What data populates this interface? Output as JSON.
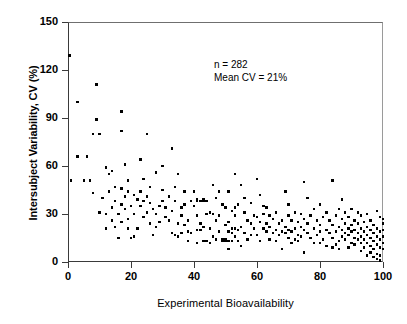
{
  "chart_data": {
    "type": "scatter",
    "title": "",
    "xlabel": "Experimental Bioavailability",
    "ylabel": "Intersubject Variability, CV (%)",
    "xlim": [
      0,
      100
    ],
    "ylim": [
      0,
      150
    ],
    "xticks": [
      0,
      20,
      40,
      60,
      80,
      100
    ],
    "yticks": [
      0,
      30,
      60,
      90,
      120,
      150
    ],
    "grid": false,
    "legend": null,
    "marker": "square",
    "marker_color": "#000000",
    "annotations": [
      "n = 282",
      "Mean CV = 21%"
    ],
    "n": 282,
    "mean_cv": 21,
    "points": [
      [
        0.5,
        129
      ],
      [
        1.0,
        51
      ],
      [
        3.0,
        100
      ],
      [
        3.0,
        66
      ],
      [
        6.0,
        66
      ],
      [
        5.0,
        51
      ],
      [
        7.0,
        51
      ],
      [
        9.0,
        111
      ],
      [
        9.0,
        89
      ],
      [
        8.0,
        80
      ],
      [
        10.0,
        80
      ],
      [
        8.0,
        43
      ],
      [
        11.0,
        40
      ],
      [
        12.0,
        59
      ],
      [
        12.0,
        30
      ],
      [
        13.0,
        55
      ],
      [
        14.0,
        57
      ],
      [
        14.0,
        34
      ],
      [
        14.0,
        26
      ],
      [
        15.0,
        47
      ],
      [
        15.0,
        22
      ],
      [
        16.0,
        30
      ],
      [
        16.0,
        15
      ],
      [
        17.0,
        94
      ],
      [
        17.0,
        82
      ],
      [
        17.0,
        46
      ],
      [
        17.0,
        36
      ],
      [
        17.0,
        25
      ],
      [
        18.0,
        61
      ],
      [
        18.0,
        41
      ],
      [
        18.0,
        33
      ],
      [
        19.0,
        44
      ],
      [
        19.0,
        27
      ],
      [
        19.0,
        21
      ],
      [
        20.0,
        15
      ],
      [
        20.0,
        35
      ],
      [
        21.0,
        42
      ],
      [
        21.0,
        30
      ],
      [
        22.0,
        39
      ],
      [
        22.0,
        21
      ],
      [
        23.0,
        64
      ],
      [
        23.0,
        44
      ],
      [
        23.0,
        35
      ],
      [
        24.0,
        38
      ],
      [
        24.0,
        28
      ],
      [
        25.0,
        80
      ],
      [
        25.0,
        41
      ],
      [
        25.0,
        31
      ],
      [
        26.0,
        47
      ],
      [
        26.0,
        37
      ],
      [
        26.0,
        24
      ],
      [
        27.0,
        33
      ],
      [
        28.0,
        56
      ],
      [
        28.0,
        30
      ],
      [
        28.0,
        22
      ],
      [
        29.0,
        35
      ],
      [
        29.0,
        25
      ],
      [
        30.0,
        60
      ],
      [
        30.0,
        45
      ],
      [
        31.0,
        34
      ],
      [
        32.0,
        41
      ],
      [
        32.0,
        26
      ],
      [
        33.0,
        71
      ],
      [
        33.0,
        32
      ],
      [
        33.0,
        18
      ],
      [
        34.0,
        38
      ],
      [
        34.0,
        17
      ],
      [
        35.0,
        55
      ],
      [
        35.0,
        24
      ],
      [
        35.0,
        16
      ],
      [
        36.0,
        29
      ],
      [
        36.0,
        18
      ],
      [
        37.0,
        44
      ],
      [
        37.0,
        36
      ],
      [
        37.0,
        23
      ],
      [
        38.0,
        26
      ],
      [
        38.0,
        19
      ],
      [
        39.0,
        38
      ],
      [
        39.0,
        18
      ],
      [
        40.0,
        44
      ],
      [
        40.0,
        35
      ],
      [
        41.0,
        39
      ],
      [
        41.0,
        38
      ],
      [
        41.0,
        20
      ],
      [
        41.0,
        12
      ],
      [
        42.0,
        38
      ],
      [
        42.0,
        24
      ],
      [
        42.0,
        20
      ],
      [
        43.0,
        39
      ],
      [
        43.0,
        38
      ],
      [
        43.0,
        22
      ],
      [
        43.0,
        13
      ],
      [
        44.0,
        38
      ],
      [
        44.0,
        13
      ],
      [
        45.0,
        31
      ],
      [
        45.0,
        21
      ],
      [
        46.0,
        48
      ],
      [
        46.0,
        30
      ],
      [
        46.0,
        16
      ],
      [
        47.0,
        26
      ],
      [
        47.0,
        14
      ],
      [
        48.0,
        44
      ],
      [
        48.0,
        29
      ],
      [
        48.0,
        19
      ],
      [
        49.0,
        14
      ],
      [
        49.0,
        13
      ],
      [
        50.0,
        34
      ],
      [
        50.0,
        23
      ],
      [
        50.0,
        14
      ],
      [
        50.0,
        13
      ],
      [
        51.0,
        44
      ],
      [
        51.0,
        25
      ],
      [
        51.0,
        19
      ],
      [
        51.0,
        13
      ],
      [
        51.0,
        8
      ],
      [
        52.0,
        32
      ],
      [
        52.0,
        21
      ],
      [
        52.0,
        18
      ],
      [
        52.0,
        13
      ],
      [
        53.0,
        55
      ],
      [
        53.0,
        29
      ],
      [
        53.0,
        21
      ],
      [
        53.0,
        16
      ],
      [
        54.0,
        36
      ],
      [
        54.0,
        20
      ],
      [
        54.0,
        13
      ],
      [
        55.0,
        48
      ],
      [
        55.0,
        22
      ],
      [
        55.0,
        10
      ],
      [
        56.0,
        31
      ],
      [
        56.0,
        18
      ],
      [
        57.0,
        26
      ],
      [
        57.0,
        14
      ],
      [
        58.0,
        37
      ],
      [
        58.0,
        24
      ],
      [
        59.0,
        29
      ],
      [
        59.0,
        21
      ],
      [
        60.0,
        52
      ],
      [
        60.0,
        28
      ],
      [
        60.0,
        17
      ],
      [
        61.0,
        42
      ],
      [
        61.0,
        25
      ],
      [
        61.0,
        13
      ],
      [
        62.0,
        30
      ],
      [
        62.0,
        21
      ],
      [
        63.0,
        34
      ],
      [
        63.0,
        24
      ],
      [
        63.0,
        19
      ],
      [
        64.0,
        29
      ],
      [
        64.0,
        22
      ],
      [
        65.0,
        27
      ],
      [
        65.0,
        18
      ],
      [
        66.0,
        31
      ],
      [
        66.0,
        20
      ],
      [
        67.0,
        24
      ],
      [
        67.0,
        17
      ],
      [
        68.0,
        26
      ],
      [
        68.0,
        19
      ],
      [
        68.0,
        8
      ],
      [
        69.0,
        44
      ],
      [
        69.0,
        22
      ],
      [
        69.0,
        18
      ],
      [
        70.0,
        36
      ],
      [
        70.0,
        29
      ],
      [
        70.0,
        20
      ],
      [
        70.0,
        15
      ],
      [
        71.0,
        26
      ],
      [
        71.0,
        19
      ],
      [
        72.0,
        31
      ],
      [
        72.0,
        21
      ],
      [
        72.0,
        14
      ],
      [
        73.0,
        25
      ],
      [
        73.0,
        17
      ],
      [
        74.0,
        30
      ],
      [
        74.0,
        22
      ],
      [
        74.0,
        16
      ],
      [
        75.0,
        50
      ],
      [
        75.0,
        27
      ],
      [
        75.0,
        20
      ],
      [
        75.0,
        6
      ],
      [
        76.0,
        40
      ],
      [
        76.0,
        24
      ],
      [
        76.0,
        18
      ],
      [
        77.0,
        29
      ],
      [
        77.0,
        15
      ],
      [
        78.0,
        33
      ],
      [
        78.0,
        21
      ],
      [
        79.0,
        26
      ],
      [
        79.0,
        17
      ],
      [
        80.0,
        36
      ],
      [
        80.0,
        23
      ],
      [
        80.0,
        19
      ],
      [
        81.0,
        28
      ],
      [
        81.0,
        14
      ],
      [
        82.0,
        31
      ],
      [
        82.0,
        20
      ],
      [
        82.0,
        10
      ],
      [
        83.0,
        26
      ],
      [
        83.0,
        18
      ],
      [
        84.0,
        51
      ],
      [
        84.0,
        23
      ],
      [
        84.0,
        15
      ],
      [
        84.0,
        9
      ],
      [
        85.0,
        29
      ],
      [
        85.0,
        19
      ],
      [
        86.0,
        33
      ],
      [
        86.0,
        22
      ],
      [
        86.0,
        13
      ],
      [
        87.0,
        39
      ],
      [
        87.0,
        27
      ],
      [
        87.0,
        20
      ],
      [
        87.0,
        16
      ],
      [
        88.0,
        31
      ],
      [
        88.0,
        24
      ],
      [
        88.0,
        18
      ],
      [
        88.0,
        14
      ],
      [
        89.0,
        28
      ],
      [
        89.0,
        21
      ],
      [
        89.0,
        17
      ],
      [
        90.0,
        33
      ],
      [
        90.0,
        23
      ],
      [
        90.0,
        19
      ],
      [
        90.0,
        12
      ],
      [
        91.0,
        26
      ],
      [
        91.0,
        20
      ],
      [
        91.0,
        15
      ],
      [
        91.0,
        11
      ],
      [
        92.0,
        24
      ],
      [
        92.0,
        18
      ],
      [
        92.0,
        14
      ],
      [
        93.0,
        29
      ],
      [
        93.0,
        21
      ],
      [
        93.0,
        16
      ],
      [
        93.0,
        12
      ],
      [
        94.0,
        25
      ],
      [
        94.0,
        19
      ],
      [
        94.0,
        14
      ],
      [
        94.0,
        9
      ],
      [
        95.0,
        30
      ],
      [
        95.0,
        22
      ],
      [
        95.0,
        17
      ],
      [
        95.0,
        12
      ],
      [
        96.0,
        26
      ],
      [
        96.0,
        20
      ],
      [
        96.0,
        15
      ],
      [
        96.0,
        10
      ],
      [
        96.0,
        6
      ],
      [
        97.0,
        23
      ],
      [
        97.0,
        18
      ],
      [
        97.0,
        13
      ],
      [
        97.0,
        8
      ],
      [
        98.0,
        32
      ],
      [
        98.0,
        21
      ],
      [
        98.0,
        16
      ],
      [
        98.0,
        11
      ],
      [
        98.0,
        5
      ],
      [
        98.0,
        2
      ],
      [
        99.0,
        28
      ],
      [
        99.0,
        19
      ],
      [
        99.0,
        14
      ],
      [
        99.0,
        9
      ],
      [
        99.0,
        4
      ],
      [
        99.0,
        1
      ],
      [
        100.0,
        27
      ],
      [
        100.0,
        24
      ],
      [
        100.0,
        20
      ],
      [
        100.0,
        16
      ],
      [
        100.0,
        12
      ],
      [
        100.0,
        8
      ],
      [
        12.0,
        21
      ],
      [
        15.0,
        38
      ],
      [
        19.0,
        51
      ],
      [
        24.0,
        52
      ],
      [
        30.0,
        38
      ],
      [
        34.0,
        47
      ],
      [
        44.0,
        30
      ],
      [
        49.0,
        36
      ],
      [
        56.0,
        40
      ],
      [
        64.0,
        14
      ],
      [
        71.0,
        12
      ],
      [
        78.0,
        12
      ],
      [
        85.0,
        11
      ],
      [
        92.0,
        31
      ],
      [
        89.0,
        9
      ],
      [
        86.0,
        8
      ],
      [
        45.0,
        12
      ],
      [
        38.0,
        13
      ],
      [
        27.0,
        17
      ],
      [
        21.0,
        16
      ],
      [
        13.0,
        44
      ],
      [
        10.0,
        31
      ],
      [
        58.0,
        17
      ],
      [
        66.0,
        13
      ],
      [
        73.0,
        13
      ],
      [
        80.0,
        12
      ],
      [
        93.0,
        7
      ],
      [
        95.0,
        4
      ],
      [
        97.0,
        3
      ],
      [
        41.0,
        29
      ],
      [
        53.0,
        34
      ],
      [
        62.0,
        35
      ],
      [
        47.0,
        40
      ],
      [
        36.0,
        34
      ],
      [
        31.0,
        28
      ]
    ]
  },
  "axis": {
    "y_tick_labels": [
      "150",
      "120",
      "90",
      "60",
      "30",
      "0"
    ],
    "x_tick_labels": [
      "0",
      "20",
      "40",
      "60",
      "80",
      "100"
    ],
    "y_title": "Intersubject Variability, CV (%)",
    "x_title": "Experimental Bioavailability"
  },
  "annotation": {
    "line1": "n = 282",
    "line2": "Mean CV = 21%"
  },
  "style": {
    "frame_color": "#3a3a3a",
    "point_color": "#000000",
    "background": "#ffffff"
  }
}
